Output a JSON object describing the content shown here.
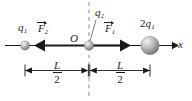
{
  "figure": {
    "type": "physics-force-diagram",
    "axis_label": "x",
    "origin_label": "O",
    "charges": [
      {
        "id": "left",
        "label": "q",
        "subscript": "1",
        "prefix": "",
        "size": "small"
      },
      {
        "id": "middle",
        "label": "q",
        "subscript": "2",
        "prefix": "",
        "size": "small"
      },
      {
        "id": "right",
        "label": "q",
        "subscript": "1",
        "prefix": "2",
        "size": "large"
      }
    ],
    "vectors": [
      {
        "id": "F2",
        "label": "F",
        "subscript": "2",
        "direction": "left",
        "overbar": "arrow"
      },
      {
        "id": "F1",
        "label": "F",
        "subscript": "1",
        "direction": "right",
        "overbar": "arrow"
      }
    ],
    "dimensions": [
      {
        "id": "left-span",
        "numerator": "L",
        "denominator": "2"
      },
      {
        "id": "right-span",
        "numerator": "L",
        "denominator": "2"
      }
    ],
    "colors": {
      "line": "#1a1a1a",
      "sphere_light": "#e8e8e8",
      "sphere_mid": "#b9b9b9",
      "sphere_dark": "#7d7d7d",
      "dashed": "#8c8c8c"
    }
  }
}
